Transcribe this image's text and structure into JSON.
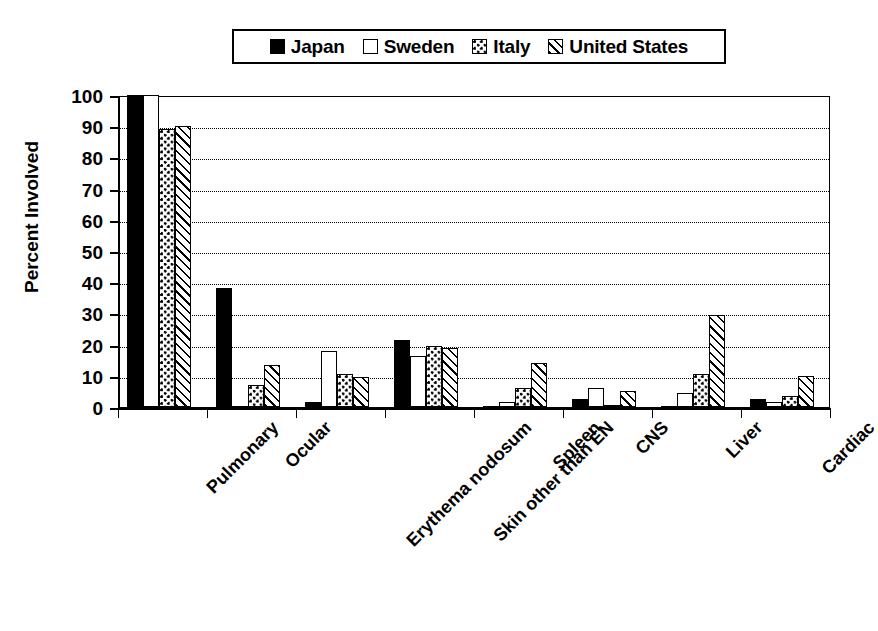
{
  "chart_data": {
    "type": "bar",
    "title": "",
    "xlabel": "",
    "ylabel": "Percent Involved",
    "ylim": [
      0,
      100
    ],
    "ytick_step": 10,
    "yticks": [
      0,
      10,
      20,
      30,
      40,
      50,
      60,
      70,
      80,
      90,
      100
    ],
    "grid": true,
    "grid_style": "dotted-horizontal",
    "legend_position": "top-center",
    "categories": [
      "Pulmonary",
      "Ocular",
      "Erythema nodosum",
      "Skin other than EN",
      "Spleen",
      "CNS",
      "Liver",
      "Cardiac"
    ],
    "series": [
      {
        "name": "Japan",
        "pattern": "solid-black",
        "values": [
          100,
          38,
          1.5,
          21.5,
          0,
          2.5,
          0,
          2.5
        ]
      },
      {
        "name": "Sweden",
        "pattern": "white-empty",
        "values": [
          100,
          0,
          18,
          16.5,
          1.5,
          6,
          4.5,
          1.5
        ]
      },
      {
        "name": "Italy",
        "pattern": "checkered-dots",
        "values": [
          89,
          7,
          10.5,
          19.5,
          6,
          0.5,
          10.5,
          3.5
        ]
      },
      {
        "name": "United States",
        "pattern": "diagonal-hatch",
        "values": [
          90,
          13.5,
          9.5,
          19,
          14,
          5,
          29.5,
          10
        ]
      }
    ]
  },
  "legend": {
    "entries": [
      {
        "label": "Japan",
        "swatch": "legend-swatch-japan"
      },
      {
        "label": "Sweden",
        "swatch": "legend-swatch-sweden"
      },
      {
        "label": "Italy",
        "swatch": "legend-swatch-italy"
      },
      {
        "label": "United States",
        "swatch": "legend-swatch-united-states"
      }
    ]
  },
  "colors": {
    "foreground": "#000000",
    "background": "#ffffff"
  }
}
